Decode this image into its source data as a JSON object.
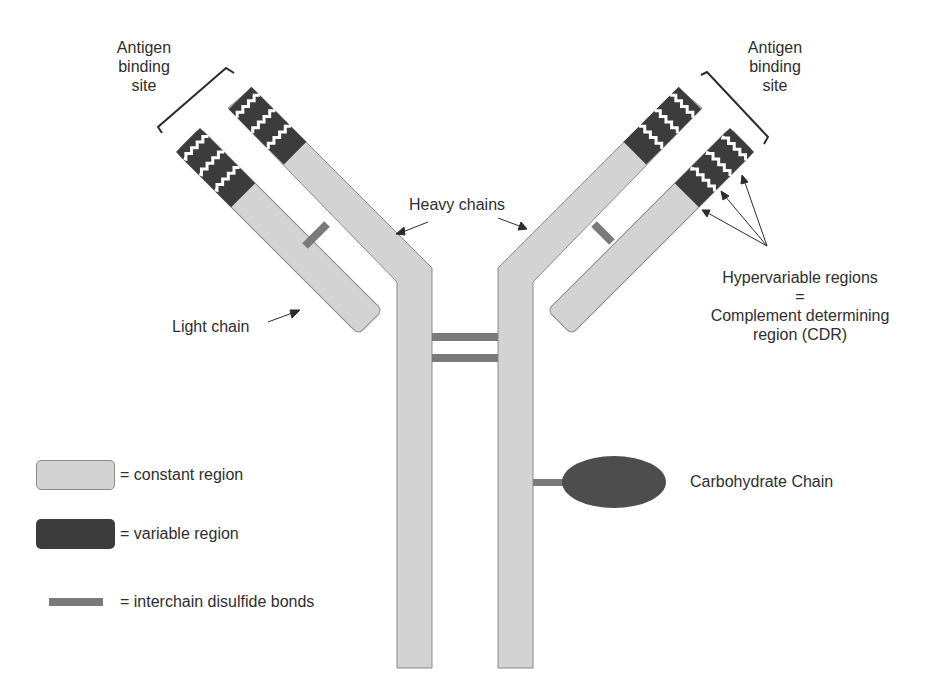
{
  "labels": {
    "antigen_left": [
      "Antigen",
      "binding",
      "site"
    ],
    "antigen_right": [
      "Antigen",
      "binding",
      "site"
    ],
    "heavy_chains": "Heavy chains",
    "light_chain": "Light chain",
    "hypervariable": [
      "Hypervariable regions",
      "=",
      "Complement determining",
      "region (CDR)"
    ],
    "carbohydrate": "Carbohydrate Chain"
  },
  "legend": [
    {
      "swatch": "constant",
      "label": "= constant region"
    },
    {
      "swatch": "variable",
      "label": "= variable region"
    },
    {
      "swatch": "bond",
      "label": "= interchain disulfide bonds"
    }
  ],
  "colors": {
    "constant": "#d3d3d3",
    "variable": "#3c3c3c",
    "bond": "#7a7a7a",
    "outline": "#8a8a8a",
    "text": "#2e2e2e"
  }
}
